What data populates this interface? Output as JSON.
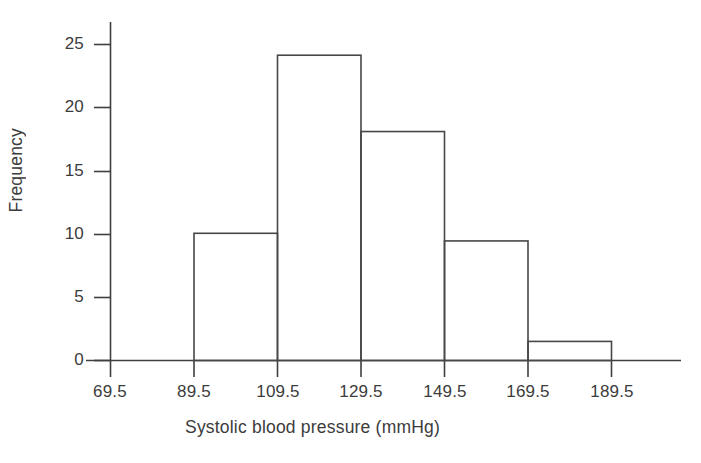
{
  "chart_data": {
    "type": "bar",
    "title": "",
    "subtitle": "",
    "xlabel": "Systolic blood pressure (mmHg)",
    "ylabel": "Frequency",
    "orientation": "vertical",
    "histogram": true,
    "bin_edges": [
      69.5,
      89.5,
      109.5,
      129.5,
      149.5,
      169.5,
      189.5
    ],
    "bin_width": 20,
    "categories": [
      "69.5-89.5",
      "89.5-109.5",
      "109.5-129.5",
      "129.5-149.5",
      "149.5-169.5",
      "169.5-189.5"
    ],
    "values": [
      0,
      10,
      24,
      18,
      9.4,
      1.5
    ],
    "bars": [
      {
        "left": 89.5,
        "right": 109.5,
        "height": 10
      },
      {
        "left": 109.5,
        "right": 129.5,
        "height": 24
      },
      {
        "left": 129.5,
        "right": 149.5,
        "height": 18
      },
      {
        "left": 149.5,
        "right": 169.5,
        "height": 9.4
      },
      {
        "left": 169.5,
        "right": 189.5,
        "height": 1.5
      }
    ],
    "xlim": [
      69.5,
      189.5
    ],
    "ylim": [
      0,
      26
    ],
    "xticks": [
      69.5,
      89.5,
      109.5,
      129.5,
      149.5,
      169.5,
      189.5
    ],
    "xtick_labels": [
      "69.5",
      "89.5",
      "109.5",
      "129.5",
      "149.5",
      "169.5",
      "189.5"
    ],
    "yticks": [
      0,
      5,
      10,
      15,
      20,
      25
    ],
    "ytick_labels": [
      "0",
      "5",
      "10",
      "15",
      "20",
      "25"
    ],
    "grid": false,
    "legend": null,
    "bar_fill": "none",
    "bar_stroke": "#474747",
    "axis_color": "#3f3f3f",
    "background": "#ffffff"
  }
}
